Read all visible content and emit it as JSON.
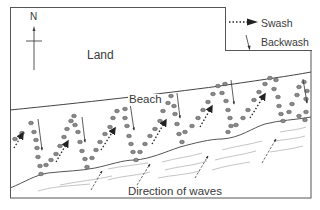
{
  "diagram": {
    "labels": {
      "north": "N",
      "land": "Land",
      "beach": "Beach",
      "waves": "Direction of waves"
    },
    "legend": {
      "items": [
        {
          "symbol": "dotted-arrow",
          "label": "Swash"
        },
        {
          "symbol": "solid-thin-arrow",
          "label": "Backwash"
        }
      ]
    },
    "colors": {
      "line": "#4a4a4a",
      "pebble": "#8a8a8a",
      "wave_line": "#b8b8b8",
      "text": "#3a3a3a"
    },
    "regions": [
      "Land",
      "Beach",
      "Sea"
    ],
    "swash_backwash_cycles": 6
  }
}
